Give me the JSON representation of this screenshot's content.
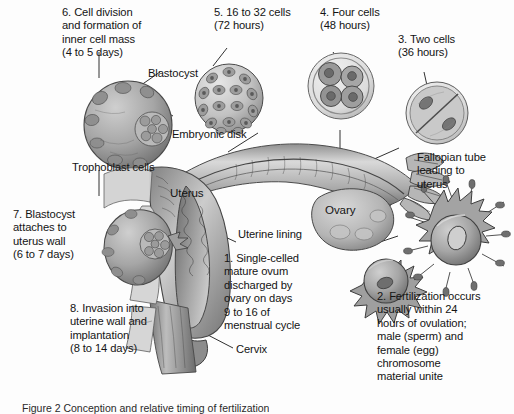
{
  "figure": {
    "caption": "Figure 2   Conception and relative timing of fertilization",
    "background_color": "#fdfdfd",
    "ink_color": "#141414"
  },
  "labels": {
    "step6": "6. Cell division\nand formation of\ninner cell mass\n(4 to 5 days)",
    "blastocyst": "Blastocyst",
    "embryonic_disk": "Embryonic disk",
    "trophoblast_cells": "Trophoblast cells",
    "step5": "5. 16 to 32 cells\n(72 hours)",
    "step4": "4. Four cells\n(48 hours)",
    "step3": "3. Two cells\n(36 hours)",
    "fallopian_tube": "Fallopian tube\nleading to\nuterus",
    "uterus": "Uterus",
    "ovary": "Ovary",
    "uterine_lining": "Uterine lining",
    "cervix": "Cervix",
    "step1": "1. Single-celled\nmature ovum\ndischarged by\novary on days\n9 to 16 of\nmenstrual cycle",
    "step2": "2. Fertilization occurs\nusually within 24\nhours of ovulation;\nmale (sperm) and\nfemale (egg)\nchromosome\nmaterial unite",
    "step7": "7. Blastocyst\nattaches to\nuterus wall\n(6 to 7 days)",
    "step8": "8. Invasion into\nuterine wall and\nimplantation\n(8 to 14 days)"
  },
  "structures": {
    "blastocyst_large": "blastocyst-illustration",
    "morula": "morula-16-32-cells-illustration",
    "four_cell": "four-cell-stage-illustration",
    "two_cell": "two-cell-stage-illustration",
    "fertilized_ovum": "fertilized-ovum-with-sperm-illustration",
    "mature_ovum": "mature-ovum-illustration",
    "implanting_blastocyst": "implanting-blastocyst-illustration",
    "uterus_body": "uterus-cross-section",
    "fallopian_tube_body": "fallopian-tube-cross-section",
    "ovary_body": "ovary-illustration",
    "fimbriae": "fimbriae-illustration",
    "cervix_body": "cervix-cross-section",
    "vagina_body": "vaginal-canal-cross-section"
  }
}
